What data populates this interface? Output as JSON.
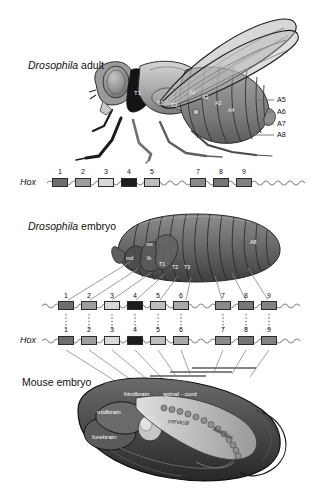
{
  "figure": {
    "kind": "biology-diagram"
  },
  "panels": {
    "adult": {
      "title_italic": "Drosophila",
      "title_rest": " adult",
      "thorax_segments": [
        "T1",
        "T2",
        "T3"
      ],
      "abdominal_inline": [
        "A1",
        "A2",
        "A3",
        "A4"
      ],
      "abdominal_leader": [
        "A5",
        "A6",
        "A7",
        "A8"
      ]
    },
    "embryo": {
      "title_italic": "Drosophila",
      "title_rest": " embryo",
      "head_segments": [
        "md",
        "mx",
        "lb"
      ],
      "thorax_segments": [
        "T1",
        "T2",
        "T3"
      ],
      "posterior_label": "A8"
    },
    "mouse": {
      "title": "Mouse embryo",
      "regions": [
        "forebrain",
        "midbrain",
        "hindbrain",
        "spinal - cord",
        "cervical",
        "thoracic"
      ]
    }
  },
  "hox": {
    "label": "Hox",
    "fly_top_numbers": [
      "1",
      "2",
      "3",
      "4",
      "5",
      "7",
      "8",
      "9"
    ],
    "fly_bottom_numbers": [
      "1",
      "2",
      "3",
      "4",
      "5",
      "6",
      "7",
      "8",
      "9"
    ],
    "mouse_numbers": [
      "1",
      "2",
      "3",
      "4",
      "5",
      "6",
      "7",
      "8",
      "9"
    ],
    "gene_colors": [
      "#6e6e6e",
      "#9d9d9d",
      "#d8d8d8",
      "#1c1c1c",
      "#bdbdbd",
      "#a8a8a8",
      "#8a8a8a",
      "#767676",
      "#828282"
    ]
  },
  "colors": {
    "ink": "#1a1a1a",
    "dna_line": "#8b8b8b",
    "leader": "#7a7a7a",
    "body_light": "#c9c9c9",
    "body_mid": "#9a9a9a",
    "body_dark": "#5a5a5a",
    "body_black": "#181818",
    "wing": "#b9b9b9",
    "background": "#ffffff"
  }
}
